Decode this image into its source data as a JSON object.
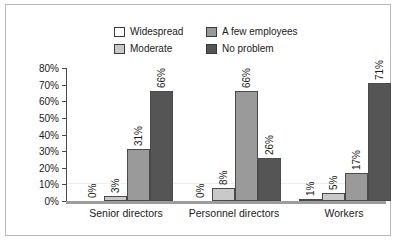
{
  "chart_data": {
    "type": "bar",
    "title": "",
    "subtitle": "",
    "xlabel": "",
    "ylabel": "",
    "ylim": [
      0,
      80
    ],
    "ytick_labels": [
      "0%",
      "10%",
      "20%",
      "30%",
      "40%",
      "50%",
      "60%",
      "70%",
      "80%"
    ],
    "ytick_values": [
      0,
      10,
      20,
      30,
      40,
      50,
      60,
      70,
      80
    ],
    "grid": false,
    "legend_position": "top",
    "categories": [
      "Senior directors",
      "Personnel directors",
      "Workers"
    ],
    "series": [
      {
        "name": "Widespread",
        "color": "#ffffff",
        "values": [
          0,
          0,
          1
        ],
        "labels": [
          "0%",
          "0%",
          "1%"
        ]
      },
      {
        "name": "Moderate",
        "color": "#c9c9c9",
        "values": [
          3,
          8,
          5
        ],
        "labels": [
          "3%",
          "8%",
          "5%"
        ]
      },
      {
        "name": "A few employees",
        "color": "#9a9a9a",
        "values": [
          31,
          66,
          17
        ],
        "labels": [
          "31%",
          "66%",
          "17%"
        ]
      },
      {
        "name": "No problem",
        "color": "#555555",
        "values": [
          66,
          26,
          71
        ],
        "labels": [
          "66%",
          "26%",
          "71%"
        ]
      }
    ]
  },
  "legend": {
    "items": [
      {
        "label": "Widespread",
        "swatch": "legend-swatch-widespread"
      },
      {
        "label": "A few employees",
        "swatch": "legend-swatch-a-few-employees"
      },
      {
        "label": "Moderate",
        "swatch": "legend-swatch-moderate"
      },
      {
        "label": "No problem",
        "swatch": "legend-swatch-no-problem"
      }
    ]
  }
}
